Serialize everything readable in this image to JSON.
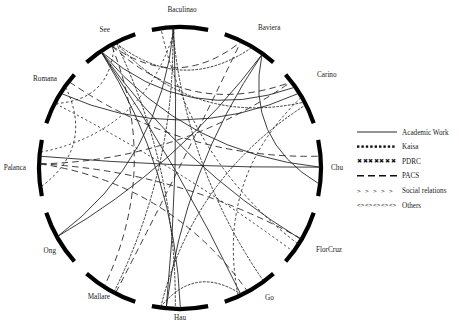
{
  "figure": {
    "type": "chord-network-diagram",
    "background": "#ffffff",
    "ink_color": "#000000",
    "width": 459,
    "height": 333
  },
  "circle": {
    "cx": 180,
    "cy": 168,
    "radius": 141,
    "node_arc_radius": 141,
    "arc_stroke_width": 4.2,
    "gap_degrees": 7
  },
  "nodes": [
    {
      "id": "baculinao",
      "label": "Baculinao",
      "angle_deg": 270,
      "label_x": 182,
      "label_y": 12
    },
    {
      "id": "baviera",
      "label": "Baviera",
      "angle_deg": 300,
      "label_x": 258,
      "label_y": 30
    },
    {
      "id": "carino",
      "label": "Carino",
      "angle_deg": 330,
      "label_x": 317,
      "label_y": 77
    },
    {
      "id": "chu",
      "label": "Chu",
      "angle_deg": 0,
      "label_x": 331,
      "label_y": 170
    },
    {
      "id": "florcruz",
      "label": "FlorCruz",
      "angle_deg": 30,
      "label_x": 316,
      "label_y": 252
    },
    {
      "id": "go",
      "label": "Go",
      "angle_deg": 60,
      "label_x": 265,
      "label_y": 300
    },
    {
      "id": "hau",
      "label": "Hau",
      "angle_deg": 90,
      "label_x": 180,
      "label_y": 320
    },
    {
      "id": "mallare",
      "label": "Mallare",
      "angle_deg": 120,
      "label_x": 110,
      "label_y": 299
    },
    {
      "id": "ong",
      "label": "Ong",
      "angle_deg": 150,
      "label_x": 56,
      "label_y": 253
    },
    {
      "id": "palanca",
      "label": "Palanca",
      "angle_deg": 180,
      "label_x": 26,
      "label_y": 170
    },
    {
      "id": "romana",
      "label": "Romana",
      "angle_deg": 210,
      "label_x": 57,
      "label_y": 81
    },
    {
      "id": "see",
      "label": "See",
      "angle_deg": 240,
      "label_x": 110,
      "label_y": 32
    }
  ],
  "legend": {
    "position": "right",
    "x": 357,
    "y": 132,
    "row_height": 14.6,
    "sample_width": 40,
    "items": [
      {
        "id": "academic-work",
        "label": "Academic Work",
        "style": "solid",
        "dash": "none"
      },
      {
        "id": "kaisa",
        "label": "Kaisa",
        "style": "dotted",
        "dash": "2.2 2.1"
      },
      {
        "id": "pdrc",
        "label": "PDRC",
        "style": "x-marks",
        "dash": "3 2.1"
      },
      {
        "id": "pacs",
        "label": "PACS",
        "style": "dashed",
        "dash": "7 4"
      },
      {
        "id": "social-relations",
        "label": "Social relations",
        "style": "chevrons",
        "dash": "none"
      },
      {
        "id": "others",
        "label": "Others",
        "style": "diamonds",
        "dash": "none"
      }
    ]
  },
  "chart_data": {
    "type": "network",
    "title": "",
    "xlabel": "",
    "ylabel": "",
    "layout": "circular chord diagram, 12 nodes, 6 edge categories",
    "categories": [
      "Academic Work",
      "Kaisa",
      "PDRC",
      "PACS",
      "Social relations",
      "Others"
    ],
    "node_order": [
      "Baculinao",
      "Baviera",
      "Carino",
      "Chu",
      "FlorCruz",
      "Go",
      "Hau",
      "Mallare",
      "Ong",
      "Palanca",
      "Romana",
      "See"
    ],
    "edges": [
      {
        "source": "see",
        "target": "baviera",
        "category": "PACS"
      },
      {
        "source": "see",
        "target": "carino",
        "category": "PACS"
      },
      {
        "source": "see",
        "target": "carino",
        "category": "Kaisa"
      },
      {
        "source": "see",
        "target": "baviera",
        "category": "Kaisa"
      },
      {
        "source": "see",
        "target": "chu",
        "category": "Academic Work"
      },
      {
        "source": "see",
        "target": "carino",
        "category": "Academic Work"
      },
      {
        "source": "see",
        "target": "florcruz",
        "category": "Academic Work"
      },
      {
        "source": "see",
        "target": "go",
        "category": "Academic Work"
      },
      {
        "source": "see",
        "target": "hau",
        "category": "Academic Work"
      },
      {
        "source": "see",
        "target": "hau",
        "category": "Kaisa"
      },
      {
        "source": "see",
        "target": "mallare",
        "category": "PACS"
      },
      {
        "source": "see",
        "target": "romana",
        "category": "Others"
      },
      {
        "source": "romana",
        "target": "palanca",
        "category": "Others"
      },
      {
        "source": "romana",
        "target": "chu",
        "category": "PACS"
      },
      {
        "source": "romana",
        "target": "carino",
        "category": "Academic Work"
      },
      {
        "source": "romana",
        "target": "florcruz",
        "category": "Social relations"
      },
      {
        "source": "palanca",
        "target": "chu",
        "category": "Academic Work"
      },
      {
        "source": "palanca",
        "target": "carino",
        "category": "PACS"
      },
      {
        "source": "palanca",
        "target": "florcruz",
        "category": "PACS"
      },
      {
        "source": "palanca",
        "target": "go",
        "category": "PACS"
      },
      {
        "source": "palanca",
        "target": "baculinao",
        "category": "Social relations"
      },
      {
        "source": "ong",
        "target": "baculinao",
        "category": "Academic Work"
      },
      {
        "source": "ong",
        "target": "baviera",
        "category": "Academic Work"
      },
      {
        "source": "mallare",
        "target": "baculinao",
        "category": "Kaisa"
      },
      {
        "source": "mallare",
        "target": "baviera",
        "category": "PACS"
      },
      {
        "source": "hau",
        "target": "baculinao",
        "category": "Academic Work"
      },
      {
        "source": "hau",
        "target": "baviera",
        "category": "Academic Work"
      },
      {
        "source": "hau",
        "target": "carino",
        "category": "Kaisa"
      },
      {
        "source": "hau",
        "target": "go",
        "category": "Kaisa"
      },
      {
        "source": "go",
        "target": "baculinao",
        "category": "Kaisa"
      },
      {
        "source": "go",
        "target": "carino",
        "category": "Others"
      },
      {
        "source": "florcruz",
        "target": "baculinao",
        "category": "Others"
      },
      {
        "source": "chu",
        "target": "baviera",
        "category": "Academic Work"
      }
    ]
  }
}
